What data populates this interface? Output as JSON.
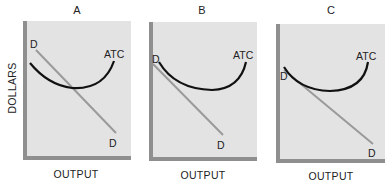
{
  "y_axis_label": "DOLLARS",
  "colors": {
    "panel_bg": "#e3e3e3",
    "axis": "#8f8f8f",
    "atc_curve": "#111111",
    "demand_line": "#9a9a9a"
  },
  "panels": [
    {
      "title": "A",
      "x_axis_label": "OUTPUT",
      "atc_label": "ATC",
      "demand_label_top": "D",
      "demand_label_bottom": "D"
    },
    {
      "title": "B",
      "x_axis_label": "OUTPUT",
      "atc_label": "ATC",
      "demand_label_top": "D",
      "demand_label_bottom": "D"
    },
    {
      "title": "C",
      "x_axis_label": "OUTPUT",
      "atc_label": "ATC",
      "demand_label_top": "D",
      "demand_label_bottom": "D"
    }
  ]
}
